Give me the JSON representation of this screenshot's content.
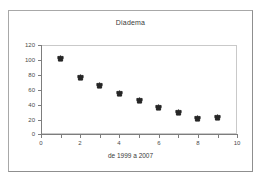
{
  "chart_data": {
    "type": "scatter",
    "title": "Diadema",
    "xlabel": "de 1999 a 2007",
    "ylabel": "",
    "x": [
      1,
      2,
      3,
      4,
      5,
      6,
      7,
      8,
      9
    ],
    "values": [
      102,
      76,
      66,
      55,
      45,
      36,
      29,
      21,
      22
    ],
    "xlim": [
      0,
      10
    ],
    "ylim": [
      0,
      120
    ],
    "xticks": [
      0,
      2,
      4,
      6,
      8,
      10
    ],
    "xticks_minor": [
      1,
      3,
      5,
      7,
      9
    ],
    "yticks": [
      0,
      20,
      40,
      60,
      80,
      100,
      120
    ],
    "grid": false,
    "legend": false,
    "marker_color": "#262626",
    "axis_color": "#7d7d7d",
    "plot_border_color": "#c9c9c9",
    "frame_color": "#a8a8a8",
    "background": "#ffffff"
  },
  "axis_labels": {
    "y": [
      "120",
      "100",
      "80",
      "60",
      "40",
      "20",
      "0"
    ],
    "x": [
      "0",
      "2",
      "4",
      "6",
      "8",
      "10"
    ]
  }
}
